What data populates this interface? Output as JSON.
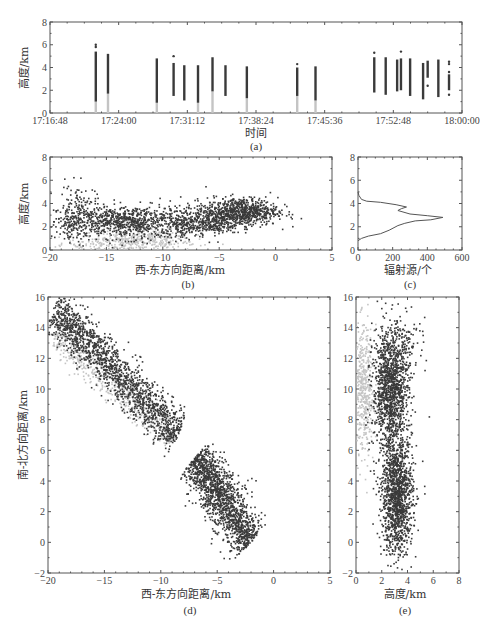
{
  "figure": {
    "panels": [
      "(a)",
      "(b)",
      "(c)",
      "(d)",
      "(e)"
    ]
  },
  "colors": {
    "frame": "#555555",
    "dark_points": "#3a3a3a",
    "light_points": "#c4c4c4",
    "curve": "#555555"
  },
  "chart_data": [
    {
      "id": "a",
      "type": "scatter",
      "title": "",
      "panel_label": "(a)",
      "xlabel": "时间",
      "ylabel": "高度/km",
      "xticks": [
        "17:16:48",
        "17:24:00",
        "17:31:12",
        "17:38:24",
        "17:45:36",
        "17:52:48",
        "18:00:00"
      ],
      "x_range_minutes": [
        0,
        43.2
      ],
      "ylim": [
        0,
        8
      ],
      "yticks": [
        0,
        2,
        4,
        6,
        8
      ],
      "series": [
        {
          "name": "flashes (time, min after 17:16:48, height range km)",
          "bars": [
            {
              "t": 6.0,
              "dark": [
                1.0,
                5.4
              ],
              "light": [
                0,
                1.0
              ],
              "outliers": [
                5.8,
                6.0
              ]
            },
            {
              "t": 7.6,
              "dark": [
                1.7,
                5.2
              ],
              "light": [
                0,
                1.7
              ],
              "outliers": []
            },
            {
              "t": 14.0,
              "dark": [
                0.9,
                4.8
              ],
              "light": [
                0,
                0.9
              ],
              "outliers": []
            },
            {
              "t": 16.2,
              "dark": [
                1.5,
                4.4
              ],
              "light": [],
              "outliers": [
                5.0
              ]
            },
            {
              "t": 17.6,
              "dark": [
                1.1,
                4.2
              ],
              "light": [],
              "outliers": []
            },
            {
              "t": 19.4,
              "dark": [
                0.9,
                4.2
              ],
              "light": [
                0,
                0.9
              ],
              "outliers": []
            },
            {
              "t": 21.3,
              "dark": [
                1.9,
                4.9
              ],
              "light": [
                0,
                1.9
              ],
              "outliers": []
            },
            {
              "t": 23.0,
              "dark": [
                1.5,
                4.2
              ],
              "light": [],
              "outliers": []
            },
            {
              "t": 25.8,
              "dark": [
                1.3,
                4.1
              ],
              "light": [
                0,
                1.3
              ],
              "outliers": []
            },
            {
              "t": 32.4,
              "dark": [
                1.5,
                4.0
              ],
              "light": [
                0,
                1.5
              ],
              "outliers": [
                4.3
              ]
            },
            {
              "t": 34.8,
              "dark": [
                1.1,
                4.1
              ],
              "light": [
                0,
                1.1
              ],
              "outliers": []
            },
            {
              "t": 42.5,
              "dark": [
                1.8,
                4.9
              ],
              "light": [],
              "outliers": [
                5.3
              ]
            },
            {
              "t": 44.0,
              "dark": [
                1.6,
                4.9
              ],
              "light": [],
              "outliers": []
            },
            {
              "t": 45.5,
              "dark": [
                1.9,
                4.7
              ],
              "light": [],
              "outliers": []
            },
            {
              "t": 46.0,
              "dark": [
                2.0,
                4.8
              ],
              "light": [],
              "outliers": [
                5.4
              ]
            },
            {
              "t": 47.2,
              "dark": [
                1.5,
                4.8
              ],
              "light": [],
              "outliers": []
            },
            {
              "t": 48.9,
              "dark": [
                1.2,
                4.4
              ],
              "light": [],
              "outliers": []
            },
            {
              "t": 49.5,
              "dark": [
                3.1,
                4.6
              ],
              "light": [],
              "outliers": [
                2.4
              ]
            },
            {
              "t": 50.9,
              "dark": [
                1.4,
                4.7
              ],
              "light": [],
              "outliers": []
            },
            {
              "t": 52.3,
              "dark": [
                2.0,
                3.4
              ],
              "light": [],
              "outliers": [
                1.6,
                3.6,
                4.3,
                4.5
              ]
            }
          ]
        }
      ]
    },
    {
      "id": "b",
      "type": "scatter",
      "panel_label": "(b)",
      "xlabel": "西-东方向距离/km",
      "ylabel": "高度/km",
      "xlim": [
        -20,
        5
      ],
      "xticks": [
        -20,
        -15,
        -10,
        -5,
        0,
        5
      ],
      "ylim": [
        0,
        8
      ],
      "yticks": [
        0,
        2,
        4,
        6,
        8
      ],
      "series": [
        {
          "name": "dark sources",
          "clusters": [
            {
              "cx": -13,
              "cy": 2.4,
              "sx": 3.2,
              "sy": 0.7,
              "n": 900
            },
            {
              "cx": -17.5,
              "cy": 3.6,
              "sx": 0.8,
              "sy": 1.0,
              "n": 120
            },
            {
              "cx": -18.3,
              "cy": 2.0,
              "sx": 0.5,
              "sy": 0.6,
              "n": 60
            },
            {
              "cx": -3,
              "cy": 3.3,
              "sx": 1.6,
              "sy": 0.6,
              "n": 700
            },
            {
              "cx": -6,
              "cy": 2.5,
              "sx": 1.4,
              "sy": 0.6,
              "n": 350
            },
            {
              "cx": -8.3,
              "cy": 1.8,
              "sx": 0.4,
              "sy": 0.5,
              "n": 40
            }
          ]
        },
        {
          "name": "light sources",
          "clusters": [
            {
              "cx": -13,
              "cy": 0.6,
              "sx": 3.0,
              "sy": 0.4,
              "n": 350
            },
            {
              "cx": -11,
              "cy": 1.3,
              "sx": 1.5,
              "sy": 0.4,
              "n": 80
            }
          ]
        }
      ]
    },
    {
      "id": "c",
      "type": "line",
      "panel_label": "(c)",
      "xlabel": "辐射源/个",
      "ylabel": "",
      "xlim": [
        0,
        600
      ],
      "xticks": [
        0,
        200,
        400,
        600
      ],
      "ylim": [
        0,
        8
      ],
      "yticks": [
        0,
        2,
        4,
        6,
        8
      ],
      "series": [
        {
          "name": "radiation source count vs height",
          "points": [
            [
              0,
              0.8
            ],
            [
              20,
              1.0
            ],
            [
              60,
              1.2
            ],
            [
              130,
              1.4
            ],
            [
              180,
              1.7
            ],
            [
              230,
              2.1
            ],
            [
              270,
              2.3
            ],
            [
              330,
              2.5
            ],
            [
              420,
              2.6
            ],
            [
              490,
              2.8
            ],
            [
              400,
              2.95
            ],
            [
              300,
              3.1
            ],
            [
              230,
              3.4
            ],
            [
              250,
              3.55
            ],
            [
              280,
              3.7
            ],
            [
              220,
              3.9
            ],
            [
              130,
              4.1
            ],
            [
              50,
              4.2
            ],
            [
              20,
              4.35
            ],
            [
              5,
              4.7
            ],
            [
              0,
              5.0
            ]
          ]
        }
      ]
    },
    {
      "id": "d",
      "type": "scatter",
      "panel_label": "(d)",
      "xlabel": "西-东方向距离/km",
      "ylabel": "南-北方向距离/km",
      "xlim": [
        -20,
        5
      ],
      "xticks": [
        -20,
        -15,
        -10,
        -5,
        0,
        5
      ],
      "ylim": [
        -2,
        16
      ],
      "yticks": [
        -2,
        0,
        2,
        4,
        6,
        8,
        10,
        12,
        14,
        16
      ],
      "series": [
        {
          "name": "dark sources",
          "band": {
            "from": [
              -19.5,
              15.3
            ],
            "to": [
              -8.5,
              6.9
            ],
            "width": 1.4,
            "n": 1600
          },
          "band2": {
            "from": [
              -7,
              5.5
            ],
            "to": [
              -2,
              0
            ],
            "width": 1.6,
            "n": 1500
          }
        },
        {
          "name": "light sources",
          "band": {
            "from": [
              -19.5,
              13.5
            ],
            "to": [
              -9,
              6.8
            ],
            "width": 1.0,
            "n": 450
          }
        }
      ]
    },
    {
      "id": "e",
      "type": "scatter",
      "panel_label": "(e)",
      "xlabel": "高度/km",
      "ylabel": "",
      "xlim": [
        0,
        8
      ],
      "xticks": [
        0,
        2,
        4,
        6,
        8
      ],
      "ylim": [
        -2,
        16
      ],
      "yticks": [
        -2,
        0,
        2,
        4,
        6,
        8,
        10,
        12,
        14,
        16
      ],
      "series": [
        {
          "name": "dark sources",
          "clusters": [
            {
              "cx": 2.7,
              "cy": 10,
              "sx": 0.7,
              "sy": 2.0,
              "n": 1300
            },
            {
              "cx": 3.2,
              "cy": 3,
              "sx": 0.6,
              "sy": 1.9,
              "n": 1300
            },
            {
              "cx": 4.0,
              "cy": 13,
              "sx": 0.7,
              "sy": 1.0,
              "n": 80
            }
          ]
        },
        {
          "name": "light sources",
          "clusters": [
            {
              "cx": 0.6,
              "cy": 9.8,
              "sx": 0.4,
              "sy": 2.1,
              "n": 450
            }
          ]
        }
      ]
    }
  ]
}
